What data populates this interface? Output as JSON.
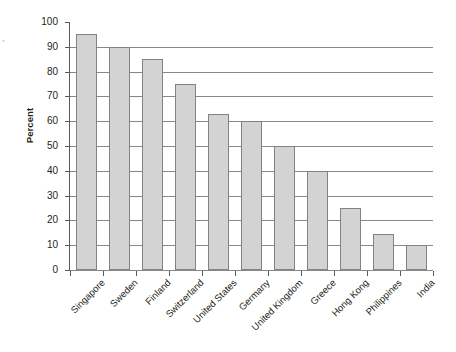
{
  "chart_data": {
    "type": "bar",
    "title": "",
    "xlabel": "",
    "ylabel": "Percent",
    "ylim": [
      0,
      100
    ],
    "ytick_step": 10,
    "yticks": [
      100,
      90,
      80,
      70,
      60,
      50,
      40,
      30,
      20,
      10,
      0
    ],
    "grid": "horizontal",
    "legend": "none",
    "bar_color": "#d3d3d3",
    "bar_border_color": "#808285",
    "categories": [
      "Singapore",
      "Sweden",
      "Finland",
      "Switzerland",
      "United States",
      "Germany",
      "United Kingdom",
      "Greece",
      "Hong Kong",
      "Philippines",
      "India"
    ],
    "values": [
      95,
      90,
      85,
      75,
      63,
      60,
      50,
      40,
      25,
      14.5,
      10
    ]
  }
}
